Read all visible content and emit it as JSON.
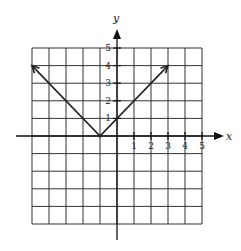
{
  "chart_data": {
    "type": "line",
    "title": "",
    "xlabel": "x",
    "ylabel": "y",
    "xlim": [
      -5,
      5
    ],
    "ylim": [
      -5,
      5
    ],
    "grid": true,
    "x_tick_labels": [
      "1",
      "2",
      "3",
      "4",
      "5"
    ],
    "y_tick_labels": [
      "1",
      "2",
      "3",
      "4",
      "5"
    ],
    "series": [
      {
        "name": "y = |x + 1|",
        "x": [
          -5,
          -1,
          3
        ],
        "y": [
          4,
          0,
          4
        ],
        "arrows_at_ends": true
      }
    ]
  },
  "labels": {
    "x_axis": "x",
    "y_axis": "y"
  }
}
